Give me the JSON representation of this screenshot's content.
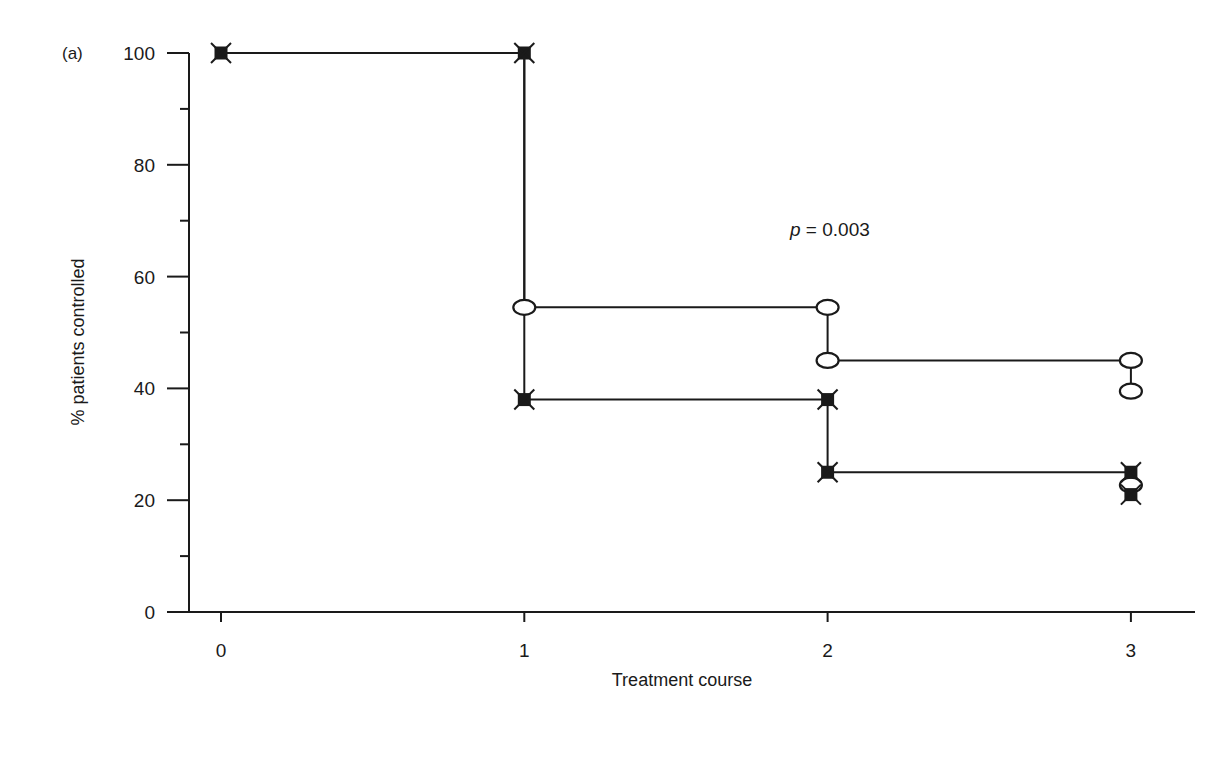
{
  "figure": {
    "panel_label": "(a)",
    "annotation": "p = 0.003",
    "annotation_italic": "p",
    "annotation_rest": " = 0.003"
  },
  "chart_data": {
    "type": "line",
    "subtype": "step (Kaplan-Meier style)",
    "title": "",
    "panel_label": "(a)",
    "xlabel": "Treatment course",
    "ylabel": "% patients controlled",
    "xlim": [
      0,
      3
    ],
    "ylim": [
      0,
      100
    ],
    "x_ticks": [
      0,
      1,
      2,
      3
    ],
    "x_tick_labels": [
      "0",
      "1",
      "2",
      "3"
    ],
    "y_ticks": [
      0,
      20,
      40,
      60,
      80,
      100
    ],
    "y_tick_labels": [
      "0",
      "20",
      "40",
      "60",
      "80",
      "100"
    ],
    "y_minor_ticks": [
      10,
      30,
      50,
      70,
      90
    ],
    "grid": false,
    "legend": null,
    "annotations": [
      {
        "text": "p = 0.003",
        "x": 2.0,
        "y": 70
      }
    ],
    "series": [
      {
        "name": "Group A (open circles)",
        "marker": "open-ellipse",
        "step_points": [
          [
            0,
            100
          ],
          [
            1,
            100
          ],
          [
            1,
            54.5
          ],
          [
            2,
            54.5
          ],
          [
            2,
            45
          ],
          [
            3,
            45
          ],
          [
            3,
            39.5
          ]
        ],
        "markers": [
          [
            1,
            54.5
          ],
          [
            2,
            54.5
          ],
          [
            2,
            45
          ],
          [
            3,
            45
          ],
          [
            3,
            39.5
          ],
          [
            3,
            22.7
          ]
        ]
      },
      {
        "name": "Group B (filled squares with crosses)",
        "marker": "filled-square-x",
        "step_points": [
          [
            0,
            100
          ],
          [
            1,
            100
          ],
          [
            1,
            38
          ],
          [
            2,
            38
          ],
          [
            2,
            25
          ],
          [
            3,
            25
          ],
          [
            3,
            21
          ]
        ],
        "markers": [
          [
            0,
            100
          ],
          [
            1,
            100
          ],
          [
            1,
            38
          ],
          [
            2,
            38
          ],
          [
            2,
            25
          ],
          [
            3,
            25
          ],
          [
            3,
            21
          ]
        ]
      }
    ]
  },
  "layout": {
    "plot": {
      "x0_px": 221,
      "x_unit_px": 303.3,
      "y0_px": 612,
      "y_unit_px": 5.59
    },
    "axis": {
      "left_px": 189,
      "bottom_px": 612,
      "right_px": 1195,
      "top_px": 53
    }
  }
}
